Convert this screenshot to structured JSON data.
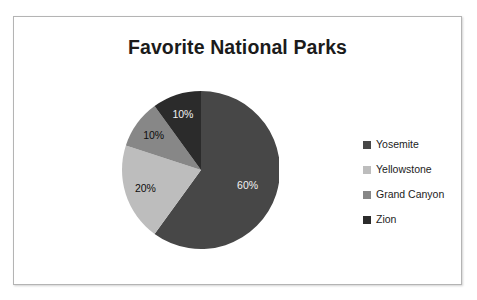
{
  "chart_data": {
    "type": "pie",
    "title": "Favorite National Parks",
    "xlabel": "",
    "ylabel": "",
    "legend_position": "right",
    "grid": false,
    "categories": [
      "Yosemite",
      "Yellowstone",
      "Grand Canyon",
      "Zion"
    ],
    "values": [
      60,
      20,
      10,
      10
    ],
    "data_labels": [
      "60%",
      "20%",
      "10%",
      "10%"
    ],
    "colors": [
      "#474747",
      "#bdbdbd",
      "#878787",
      "#2b2b2b"
    ],
    "start_angle_deg": 0,
    "direction": "clockwise",
    "slices": [
      {
        "name": "Yosemite",
        "value": 60,
        "label": "60%",
        "color": "#474747",
        "start_deg": 0,
        "end_deg": 216,
        "label_on_dark": true
      },
      {
        "name": "Yellowstone",
        "value": 20,
        "label": "20%",
        "color": "#bdbdbd",
        "start_deg": 216,
        "end_deg": 288,
        "label_on_dark": false
      },
      {
        "name": "Grand Canyon",
        "value": 10,
        "label": "10%",
        "color": "#878787",
        "start_deg": 288,
        "end_deg": 324,
        "label_on_dark": false
      },
      {
        "name": "Zion",
        "value": 10,
        "label": "10%",
        "color": "#2b2b2b",
        "start_deg": 324,
        "end_deg": 360,
        "label_on_dark": true
      }
    ]
  },
  "chart": {
    "title": "Favorite National Parks"
  },
  "legend": {
    "items": [
      {
        "label": "Yosemite",
        "color": "#474747"
      },
      {
        "label": "Yellowstone",
        "color": "#bdbdbd"
      },
      {
        "label": "Grand Canyon",
        "color": "#878787"
      },
      {
        "label": "Zion",
        "color": "#2b2b2b"
      }
    ]
  }
}
